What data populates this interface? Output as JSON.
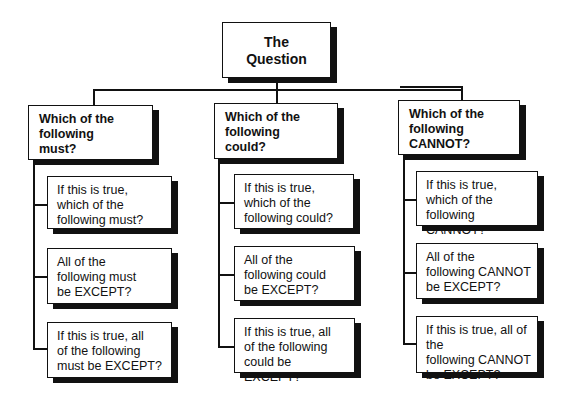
{
  "diagram": {
    "type": "tree",
    "root": {
      "label": "The\nQuestion"
    },
    "branches": [
      {
        "label": "Which of the\nfollowing\nmust?",
        "children": [
          {
            "label": "If this is true,\nwhich of the\nfollowing must?"
          },
          {
            "label": "All of the\nfollowing must\nbe EXCEPT?"
          },
          {
            "label": "If this is true, all\nof the following\nmust be EXCEPT?"
          }
        ]
      },
      {
        "label": "Which of the\nfollowing\ncould?",
        "children": [
          {
            "label": "If this is true,\nwhich of the\nfollowing could?"
          },
          {
            "label": "All of the\nfollowing could\nbe EXCEPT?"
          },
          {
            "label": "If this is true, all\nof the following\ncould be EXCEPT?"
          }
        ]
      },
      {
        "label": "Which of the\nfollowing\nCANNOT?",
        "children": [
          {
            "label": "If this is true,\nwhich of the\nfollowing CANNOT?"
          },
          {
            "label": "All of the\nfollowing CANNOT\nbe EXCEPT?"
          },
          {
            "label": "If this is true, all of the\nfollowing CANNOT\nbe EXCEPT?"
          }
        ]
      }
    ]
  },
  "colors": {
    "line": "#111111",
    "box_fill": "#ffffff",
    "shadow": "#111111",
    "background": "#ffffff"
  }
}
